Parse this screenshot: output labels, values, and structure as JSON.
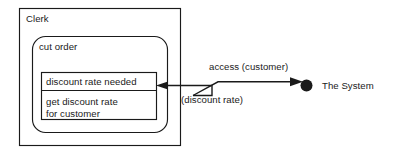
{
  "diagram": {
    "type": "uml-interaction-diagram",
    "stroke_color": "#1a1a1a",
    "background_color": "#ffffff",
    "outer_box": {
      "label": "Clerk"
    },
    "rounded_box": {
      "label": "cut order"
    },
    "inner_box": {
      "compartments": [
        {
          "label": "discount rate needed"
        },
        {
          "label": "get discount rate\nfor customer"
        }
      ]
    },
    "connectors": [
      {
        "name": "access-connector",
        "label": "access (customer)",
        "direction": "to-system"
      },
      {
        "name": "return-connector",
        "label": "(discount rate)",
        "direction": "to-clerk"
      }
    ],
    "system_node": {
      "label": "The System",
      "marker": "filled-circle"
    }
  }
}
